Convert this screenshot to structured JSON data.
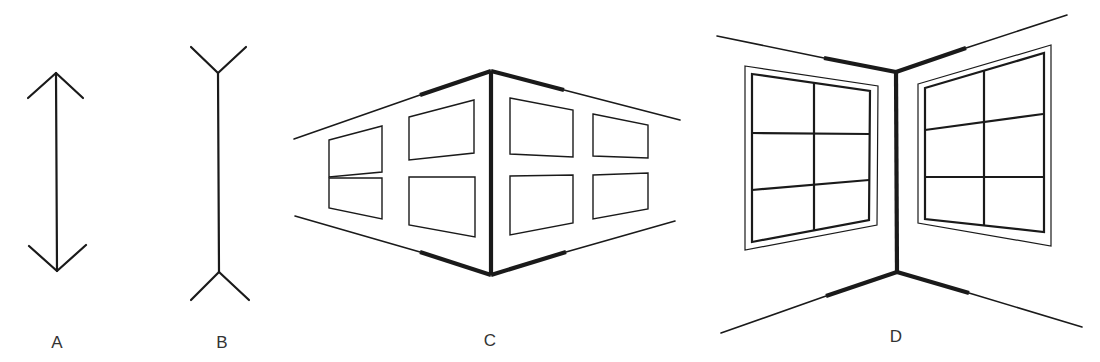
{
  "figure": {
    "panels": [
      {
        "id": "A",
        "label": "A",
        "description": "Vertical line with outward-pointing arrowheads (fins converging)"
      },
      {
        "id": "B",
        "label": "B",
        "description": "Vertical line with inward fins (fins diverging, Y-shaped ends)"
      },
      {
        "id": "C",
        "label": "C",
        "description": "Outside corner of a building seen in perspective, with four windows on each wall"
      },
      {
        "id": "D",
        "label": "D",
        "description": "Inside corner of a room seen in perspective, with a six-pane window on each wall"
      }
    ]
  },
  "colors": {
    "ink": "#1a1a1a",
    "label": "#333333",
    "background": "#ffffff"
  }
}
